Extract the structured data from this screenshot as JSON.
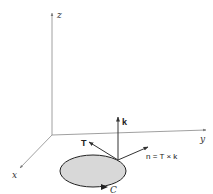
{
  "diagram": {
    "axes": {
      "z_label": "z",
      "y_label": "y",
      "x_label": "x"
    },
    "curve": {
      "label": "C",
      "fill_color": "#d8d8d8",
      "stroke_color": "#222222"
    },
    "vectors": {
      "tangent_label": "T",
      "k_label": "k",
      "normal_label": "n = T × k"
    },
    "colors": {
      "axis": "#888888",
      "vector": "#333333",
      "background": "#ffffff"
    }
  }
}
